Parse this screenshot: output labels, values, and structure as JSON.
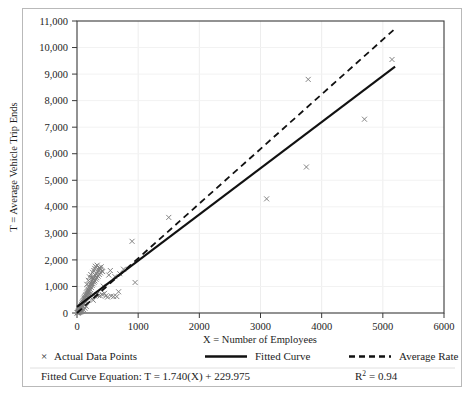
{
  "chart_data": {
    "type": "scatter",
    "title": "",
    "xlabel": "X = Number of Employees",
    "ylabel": "T = Average Vehicle Trip Ends",
    "xlim": [
      0,
      6000
    ],
    "ylim": [
      0,
      11000
    ],
    "xticks": [
      0,
      1000,
      2000,
      3000,
      4000,
      5000,
      6000
    ],
    "xtick_labels": [
      "0",
      "1000",
      "2000",
      "3000",
      "4000",
      "5000",
      "6000"
    ],
    "yticks": [
      0,
      1000,
      2000,
      3000,
      4000,
      5000,
      6000,
      7000,
      8000,
      9000,
      10000,
      11000
    ],
    "ytick_labels": [
      "0",
      "1,000",
      "2,000",
      "3,000",
      "4,000",
      "5,000",
      "6,000",
      "7,000",
      "8,000",
      "9,000",
      "10,000",
      "11,000"
    ],
    "grid": true,
    "legend_position": "below-axes",
    "series": [
      {
        "name": "Actual Data Points",
        "type": "scatter",
        "marker": "x",
        "color": "#7d7d7d",
        "points": [
          [
            20,
            40
          ],
          [
            25,
            70
          ],
          [
            30,
            55
          ],
          [
            35,
            110
          ],
          [
            40,
            90
          ],
          [
            45,
            150
          ],
          [
            50,
            130
          ],
          [
            55,
            200
          ],
          [
            58,
            160
          ],
          [
            62,
            240
          ],
          [
            65,
            190
          ],
          [
            70,
            280
          ],
          [
            72,
            230
          ],
          [
            75,
            330
          ],
          [
            80,
            300
          ],
          [
            85,
            380
          ],
          [
            88,
            260
          ],
          [
            92,
            420
          ],
          [
            95,
            350
          ],
          [
            100,
            470
          ],
          [
            105,
            400
          ],
          [
            110,
            520
          ],
          [
            112,
            330
          ],
          [
            118,
            560
          ],
          [
            120,
            450
          ],
          [
            125,
            610
          ],
          [
            130,
            500
          ],
          [
            135,
            660
          ],
          [
            140,
            560
          ],
          [
            145,
            700
          ],
          [
            150,
            430
          ],
          [
            155,
            760
          ],
          [
            160,
            620
          ],
          [
            165,
            810
          ],
          [
            170,
            690
          ],
          [
            175,
            860
          ],
          [
            180,
            590
          ],
          [
            185,
            900
          ],
          [
            190,
            760
          ],
          [
            195,
            960
          ],
          [
            200,
            820
          ],
          [
            205,
            1010
          ],
          [
            210,
            700
          ],
          [
            215,
            1070
          ],
          [
            220,
            880
          ],
          [
            228,
            1120
          ],
          [
            235,
            960
          ],
          [
            240,
            1190
          ],
          [
            248,
            1040
          ],
          [
            255,
            1240
          ],
          [
            262,
            1100
          ],
          [
            270,
            1300
          ],
          [
            278,
            1160
          ],
          [
            285,
            1360
          ],
          [
            292,
            1210
          ],
          [
            300,
            1420
          ],
          [
            310,
            1270
          ],
          [
            318,
            1480
          ],
          [
            325,
            1330
          ],
          [
            335,
            1550
          ],
          [
            345,
            1390
          ],
          [
            355,
            1620
          ],
          [
            365,
            1450
          ],
          [
            375,
            1680
          ],
          [
            385,
            1510
          ],
          [
            395,
            1740
          ],
          [
            405,
            1580
          ],
          [
            300,
            1760
          ],
          [
            330,
            1800
          ],
          [
            360,
            1700
          ],
          [
            390,
            1640
          ],
          [
            420,
            1560
          ],
          [
            430,
            1010
          ],
          [
            450,
            740
          ],
          [
            470,
            640
          ],
          [
            500,
            600
          ],
          [
            520,
            1430
          ],
          [
            545,
            1600
          ],
          [
            560,
            640
          ],
          [
            600,
            620
          ],
          [
            620,
            1370
          ],
          [
            650,
            620
          ],
          [
            680,
            800
          ],
          [
            700,
            1480
          ],
          [
            760,
            1650
          ],
          [
            900,
            2700
          ],
          [
            950,
            1150
          ],
          [
            1500,
            3600
          ],
          [
            3100,
            4300
          ],
          [
            3750,
            5500
          ],
          [
            3780,
            8800
          ],
          [
            4700,
            7300
          ],
          [
            5150,
            9550
          ],
          [
            240,
            1330
          ],
          [
            250,
            520
          ],
          [
            265,
            480
          ],
          [
            290,
            640
          ],
          [
            150,
            250
          ],
          [
            130,
            180
          ],
          [
            110,
            120
          ],
          [
            95,
            90
          ],
          [
            78,
            70
          ],
          [
            66,
            60
          ],
          [
            54,
            45
          ],
          [
            44,
            38
          ],
          [
            34,
            30
          ],
          [
            26,
            22
          ],
          [
            18,
            16
          ],
          [
            14,
            12
          ],
          [
            10,
            9
          ],
          [
            8,
            7
          ],
          [
            6,
            5
          ],
          [
            320,
            700
          ],
          [
            350,
            660
          ],
          [
            380,
            650
          ],
          [
            410,
            700
          ],
          [
            160,
            1080
          ],
          [
            185,
            1230
          ],
          [
            205,
            1360
          ],
          [
            225,
            1450
          ],
          [
            255,
            1530
          ],
          [
            275,
            1600
          ],
          [
            290,
            1680
          ]
        ]
      },
      {
        "name": "Fitted Curve",
        "type": "line",
        "style": "solid",
        "color": "#111111",
        "equation_slope": 1.74,
        "equation_intercept": 229.975,
        "x_range": [
          0,
          5200
        ]
      },
      {
        "name": "Average Rate",
        "type": "line",
        "style": "dashed",
        "color": "#111111",
        "slope": 2.06,
        "intercept": 0,
        "x_range": [
          0,
          5200
        ]
      }
    ],
    "annotations": {
      "equation_text": "Fitted Curve Equation: T = 1.740(X) + 229.975",
      "r_squared_prefix": "R",
      "r_squared_sup": "2",
      "r_squared_value": "= 0.94"
    }
  },
  "legend": {
    "items": [
      {
        "label": "Actual Data Points",
        "marker": "x-marker"
      },
      {
        "label": "Fitted Curve",
        "marker": "solid-line"
      },
      {
        "label": "Average Rate",
        "marker": "dashed-line"
      }
    ]
  }
}
